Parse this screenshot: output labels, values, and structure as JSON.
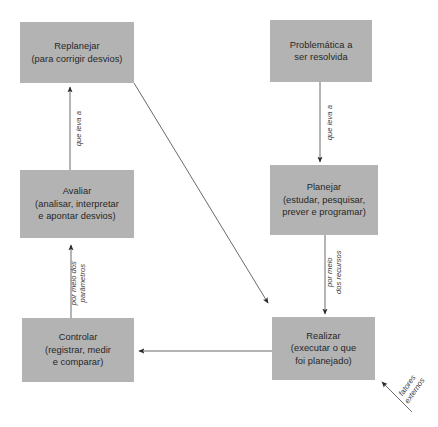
{
  "diagram": {
    "background_color": "#ffffff",
    "box_fill_color": "#b3b3b3",
    "text_color": "#262626",
    "line_color": "#4d4d4d",
    "nodes": [
      {
        "id": "replanejar",
        "lines": [
          "Replanejar",
          "(para corrigir desvios)"
        ]
      },
      {
        "id": "problematica",
        "lines": [
          "Problemática a",
          "ser resolvida"
        ]
      },
      {
        "id": "avaliar",
        "lines": [
          "Avaliar",
          "(analisar, interpretar",
          "e apontar desvios)"
        ]
      },
      {
        "id": "planejar",
        "lines": [
          "Planejar",
          "(estudar, pesquisar,",
          "prever e programar)"
        ]
      },
      {
        "id": "controlar",
        "lines": [
          "Controlar",
          "(registrar, medir",
          "e comparar)"
        ]
      },
      {
        "id": "realizar",
        "lines": [
          "Realizar",
          "(executar o que",
          "foi planejado)"
        ]
      }
    ],
    "edge_labels": [
      {
        "id": "avaliar-to-replanejar",
        "lines": [
          "que leva a"
        ]
      },
      {
        "id": "problematica-to-planejar",
        "lines": [
          "que leva a"
        ]
      },
      {
        "id": "controlar-to-avaliar",
        "lines": [
          "por meio dos",
          "parâmetros"
        ]
      },
      {
        "id": "planejar-to-realizar",
        "lines": [
          "por meio",
          "dos recursos"
        ]
      },
      {
        "id": "fatores-externos",
        "lines": [
          "fatores",
          "externos"
        ]
      }
    ]
  }
}
